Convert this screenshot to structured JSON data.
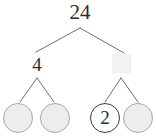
{
  "diagram": {
    "type": "factor-tree",
    "title_text": "",
    "root": {
      "label": "24",
      "shape": "plain-number"
    },
    "level2": [
      {
        "label": "4",
        "shape": "plain-number",
        "filled": true
      },
      {
        "label": "",
        "shape": "blank-square",
        "filled": false
      }
    ],
    "leaves": [
      {
        "label": "",
        "shape": "circle",
        "filled": false
      },
      {
        "label": "",
        "shape": "circle",
        "filled": false
      },
      {
        "label": "2",
        "shape": "circle",
        "filled": true
      },
      {
        "label": "",
        "shape": "circle",
        "filled": false
      }
    ],
    "colors": {
      "line": "#6e6e6e",
      "text": "#2b2b2b",
      "empty_fill": "#ededed",
      "empty_stroke": "#a8a8a8",
      "filled_fill": "#ffffff",
      "filled_stroke": "#3a3a3a",
      "blank_box_fill": "#f2f2f2",
      "background": "#ffffff"
    }
  }
}
